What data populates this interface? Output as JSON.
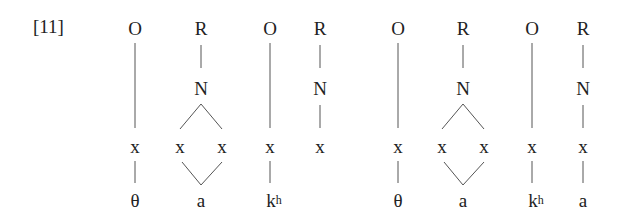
{
  "example_number": "[11]",
  "colors": {
    "text": "#222222",
    "lines": "#555555",
    "background": "#ffffff"
  },
  "trees": [
    {
      "name": "left-representation",
      "constituents": [
        {
          "label": "O",
          "skeletal": [
            "x"
          ],
          "segment": "θ"
        },
        {
          "label": "R",
          "nucleus": "N",
          "skeletal": [
            "x",
            "x"
          ],
          "segment": "a",
          "branching": true
        },
        {
          "label": "O",
          "skeletal": [
            "x"
          ],
          "segment_base": "k",
          "segment_sup": "h"
        },
        {
          "label": "R",
          "nucleus": "N",
          "skeletal": [
            "x"
          ],
          "segment": ""
        }
      ]
    },
    {
      "name": "right-representation",
      "constituents": [
        {
          "label": "O",
          "skeletal": [
            "x"
          ],
          "segment": "θ"
        },
        {
          "label": "R",
          "nucleus": "N",
          "skeletal": [
            "x",
            "x"
          ],
          "segment": "a",
          "branching": true
        },
        {
          "label": "O",
          "skeletal": [
            "x"
          ],
          "segment_base": "k",
          "segment_sup": "h"
        },
        {
          "label": "R",
          "nucleus": "N",
          "skeletal": [
            "x"
          ],
          "segment": "a"
        }
      ]
    }
  ]
}
